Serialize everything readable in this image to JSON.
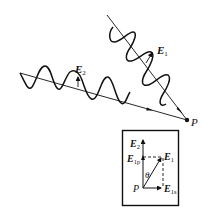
{
  "diagram": {
    "colors": {
      "stroke": "#111111",
      "background": "#ffffff"
    },
    "wave1": {
      "label_main": "E",
      "label_sub": "1",
      "direction": "downward-right toward P"
    },
    "wave2": {
      "label_main": "E",
      "label_sub": "2",
      "direction": "rightward toward P"
    },
    "point": {
      "label": "P"
    },
    "inset": {
      "origin_label": "P",
      "angle_label": "θ",
      "vectors": [
        {
          "main": "E",
          "sub": "2",
          "position": "vertical-top"
        },
        {
          "main": "E",
          "sub": "1p",
          "position": "vertical-component"
        },
        {
          "main": "E",
          "sub": "1",
          "position": "diagonal"
        },
        {
          "main": "E",
          "sub": "1s",
          "position": "horizontal-component"
        }
      ]
    }
  }
}
